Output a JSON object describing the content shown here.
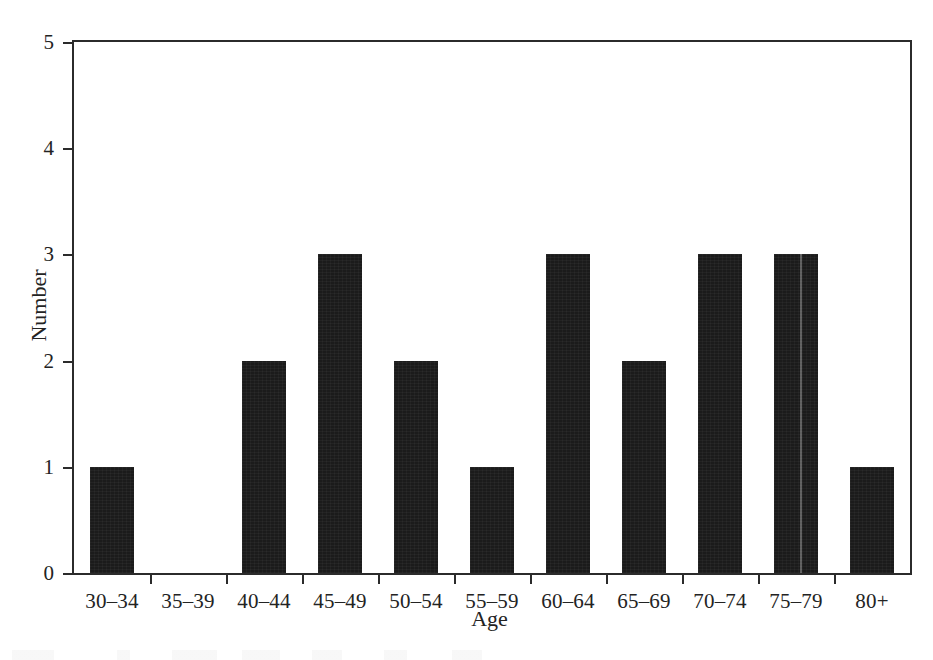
{
  "chart_data": {
    "type": "bar",
    "title": "",
    "xlabel": "Age",
    "ylabel": "Number",
    "categories": [
      "30–34",
      "35–39",
      "40–44",
      "45–49",
      "50–54",
      "55–59",
      "60–64",
      "65–69",
      "70–74",
      "75–79",
      "80+"
    ],
    "values": [
      1,
      0,
      2,
      3,
      2,
      1,
      3,
      2,
      3,
      3,
      1
    ],
    "ylim": [
      0,
      5
    ],
    "yticks": [
      0,
      1,
      2,
      3,
      4,
      5
    ],
    "ytick_labels": [
      "0",
      "1",
      "2",
      "3",
      "4",
      "5"
    ],
    "grid": false,
    "legend": false,
    "bar_color": "#1b1b1b",
    "axis_color": "#2b2b2b",
    "background": "#ffffff"
  },
  "figure": {
    "xlabel": "Age",
    "ylabel": "Number"
  }
}
